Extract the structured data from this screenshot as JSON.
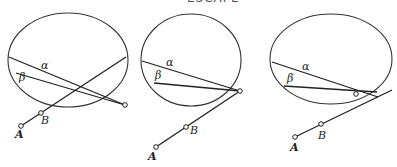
{
  "title_cutoff": "··· ··· ··· ··· ESCAPE",
  "labels": {
    "alpha": "α",
    "beta": "β",
    "A": "A",
    "B": "B"
  },
  "diagrams": [
    {
      "id": "case-1",
      "description": "Line AB extended crosses ellipse; alpha and beta rays converge at point outside ellipse below right"
    },
    {
      "id": "case-2",
      "description": "Line AB extended meets ellipse exactly at convergence point of alpha and beta rays"
    },
    {
      "id": "case-3",
      "description": "Convergence point inside ellipse near edge; AB line passes below it"
    }
  ]
}
